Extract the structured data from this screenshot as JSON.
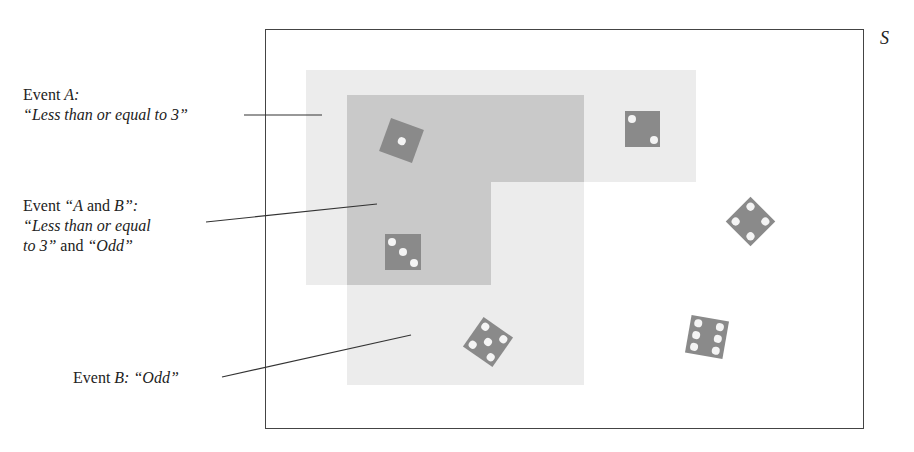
{
  "diagram": {
    "sample_space_label": "S",
    "labels": {
      "event_a": {
        "line1_prefix": "Event ",
        "line1_var": "A:",
        "line2": "“Less than or equal to 3”"
      },
      "event_ab": {
        "line1_prefix": "Event ",
        "line1_quote_open": "“A",
        "line1_and": " and ",
        "line1_var_b": "B”:",
        "line2": "“Less than or equal",
        "line3_italic": "to 3”",
        "line3_and": " and ",
        "line3_odd": "“Odd”"
      },
      "event_b": {
        "line1_prefix": "Event ",
        "line1_var": "B:",
        "line1_value": " “Odd”"
      }
    },
    "dice": [
      {
        "face": 1,
        "in_a": true,
        "in_b": true
      },
      {
        "face": 2,
        "in_a": true,
        "in_b": false
      },
      {
        "face": 3,
        "in_a": true,
        "in_b": true
      },
      {
        "face": 4,
        "in_a": false,
        "in_b": false
      },
      {
        "face": 5,
        "in_a": false,
        "in_b": true
      },
      {
        "face": 6,
        "in_a": false,
        "in_b": false
      }
    ],
    "colors": {
      "region_light": "#ececec",
      "region_overlap": "#c9c9c9",
      "die_fill": "#8a8a8a",
      "pip": "#f4f4f4",
      "border": "#444444"
    }
  }
}
